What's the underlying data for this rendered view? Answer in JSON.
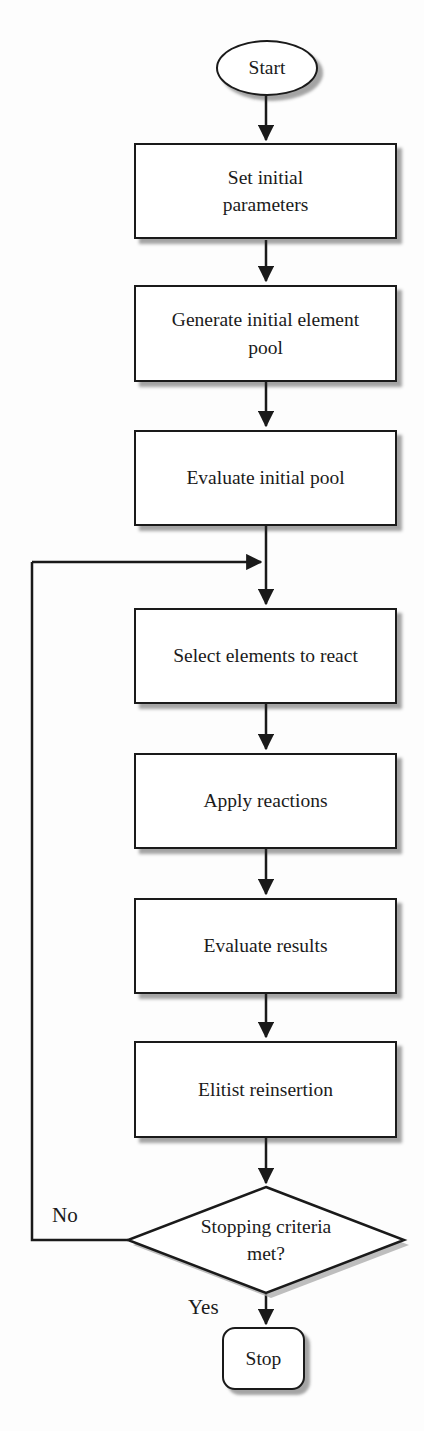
{
  "diagram": {
    "kind": "flowchart",
    "colors": {
      "background": "#fdfdfd",
      "shape_fill": "#ffffff",
      "line": "#1a1a1a",
      "shadow": "#a8a8a8",
      "text": "#1b1b1b"
    },
    "nodes": [
      {
        "id": "start",
        "shape": "terminator-ellipse",
        "label": "Start"
      },
      {
        "id": "set-initial-parameters",
        "shape": "process",
        "label": "Set initial\nparameters"
      },
      {
        "id": "generate-initial-element-pool",
        "shape": "process",
        "label": "Generate initial element\npool"
      },
      {
        "id": "evaluate-initial-pool",
        "shape": "process",
        "label": "Evaluate initial pool"
      },
      {
        "id": "select-elements-to-react",
        "shape": "process",
        "label": "Select elements to react"
      },
      {
        "id": "apply-reactions",
        "shape": "process",
        "label": "Apply reactions"
      },
      {
        "id": "evaluate-results",
        "shape": "process",
        "label": "Evaluate results"
      },
      {
        "id": "elitist-reinsertion",
        "shape": "process",
        "label": "Elitist reinsertion"
      },
      {
        "id": "stopping-criteria-met",
        "shape": "decision",
        "label": "Stopping criteria\nmet?"
      },
      {
        "id": "stop",
        "shape": "terminator-rounded",
        "label": "Stop"
      }
    ],
    "edges": [
      {
        "from": "start",
        "to": "set-initial-parameters",
        "label": ""
      },
      {
        "from": "set-initial-parameters",
        "to": "generate-initial-element-pool",
        "label": ""
      },
      {
        "from": "generate-initial-element-pool",
        "to": "evaluate-initial-pool",
        "label": ""
      },
      {
        "from": "evaluate-initial-pool",
        "to": "select-elements-to-react",
        "label": ""
      },
      {
        "from": "select-elements-to-react",
        "to": "apply-reactions",
        "label": ""
      },
      {
        "from": "apply-reactions",
        "to": "evaluate-results",
        "label": ""
      },
      {
        "from": "evaluate-results",
        "to": "elitist-reinsertion",
        "label": ""
      },
      {
        "from": "elitist-reinsertion",
        "to": "stopping-criteria-met",
        "label": ""
      },
      {
        "from": "stopping-criteria-met",
        "to": "select-elements-to-react",
        "label": "No"
      },
      {
        "from": "stopping-criteria-met",
        "to": "stop",
        "label": "Yes"
      }
    ]
  }
}
